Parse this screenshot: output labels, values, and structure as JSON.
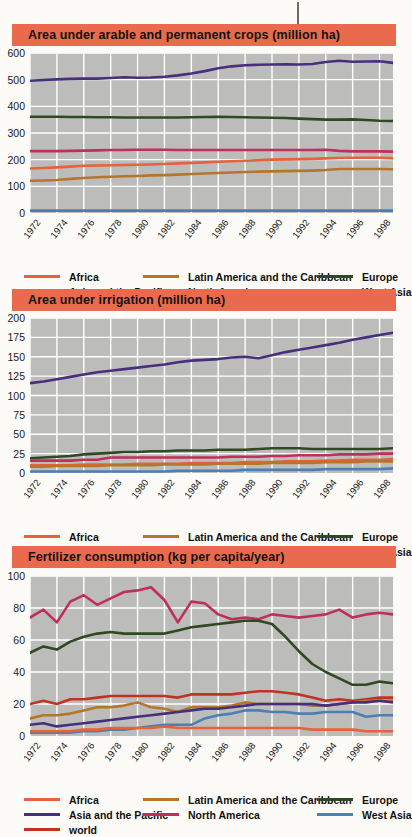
{
  "page": {
    "background": "#fdfbf7",
    "title_bar_color": "#ea6a4d",
    "plot_background": "#bcbcba",
    "grid_color": "#ffffff"
  },
  "series_colors": {
    "Africa": "#e8613a",
    "Asia and the Pacific": "#46307d",
    "Latin America and the Caribbean": "#b5762c",
    "North America": "#bf2f5c",
    "Europe": "#2f4a22",
    "West Asia": "#4b7fb5",
    "world": "#bf3322"
  },
  "legend": {
    "entries": [
      {
        "label": "Africa",
        "color": "#e8613a"
      },
      {
        "label": "Latin America and the Caribbean",
        "color": "#b5762c"
      },
      {
        "label": "Europe",
        "color": "#2f4a22"
      },
      {
        "label": "Asia and the Pacific",
        "color": "#46307d"
      },
      {
        "label": "North America",
        "color": "#bf2f5c"
      },
      {
        "label": "West Asia",
        "color": "#4b7fb5"
      },
      {
        "label": "world",
        "color": "#bf3322"
      }
    ]
  },
  "charts": [
    {
      "id": "arable",
      "title": "Area under arable and permanent crops (million ha)",
      "legend_labels": [
        "Africa",
        "Latin America and the Caribbean",
        "Europe",
        "Asia and the Pacific",
        "North America",
        "West Asia"
      ]
    },
    {
      "id": "irrigation",
      "title": "Area under irrigation (million ha)",
      "legend_labels": [
        "Africa",
        "Latin America and the Caribbean",
        "Europe",
        "Asia and the Pacific",
        "North America",
        "West Asia"
      ]
    },
    {
      "id": "fertilizer",
      "title": "Fertilizer consumption (kg per capita/year)",
      "legend_labels": [
        "Africa",
        "Latin America and the Caribbean",
        "Europe",
        "Asia and the Pacific",
        "North America",
        "West Asia",
        "world"
      ]
    }
  ],
  "chart_data": [
    {
      "type": "line",
      "id": "arable",
      "title": "Area under arable and permanent crops (million ha)",
      "xlabel": "",
      "ylabel": "million ha",
      "grid": true,
      "legend_position": "bottom",
      "xlim": [
        1972,
        1999
      ],
      "ylim": [
        0,
        600
      ],
      "yticks": [
        0,
        100,
        200,
        300,
        400,
        500,
        600
      ],
      "xticks": [
        1972,
        1974,
        1976,
        1978,
        1980,
        1982,
        1984,
        1986,
        1988,
        1990,
        1992,
        1994,
        1996,
        1998
      ],
      "x": [
        1972,
        1973,
        1974,
        1975,
        1976,
        1977,
        1978,
        1979,
        1980,
        1981,
        1982,
        1983,
        1984,
        1985,
        1986,
        1987,
        1988,
        1989,
        1990,
        1991,
        1992,
        1993,
        1994,
        1995,
        1996,
        1997,
        1998,
        1999
      ],
      "series": [
        {
          "name": "Asia and the Pacific",
          "color": "#46307d",
          "values": [
            496,
            499,
            501,
            503,
            504,
            504,
            506,
            509,
            507,
            508,
            511,
            516,
            523,
            532,
            543,
            550,
            554,
            556,
            557,
            558,
            557,
            559,
            566,
            571,
            567,
            568,
            569,
            563
          ]
        },
        {
          "name": "Europe",
          "color": "#2f4a22",
          "values": [
            361,
            361,
            361,
            360,
            360,
            359,
            359,
            358,
            358,
            358,
            358,
            358,
            359,
            360,
            361,
            360,
            359,
            358,
            357,
            356,
            354,
            352,
            350,
            350,
            351,
            349,
            346,
            345
          ]
        },
        {
          "name": "North America",
          "color": "#bf2f5c",
          "values": [
            232,
            232,
            232,
            233,
            234,
            235,
            236,
            236,
            237,
            237,
            237,
            236,
            236,
            236,
            236,
            236,
            236,
            236,
            236,
            236,
            236,
            236,
            237,
            233,
            231,
            231,
            231,
            230
          ]
        },
        {
          "name": "Africa",
          "color": "#e8613a",
          "values": [
            167,
            169,
            171,
            174,
            177,
            178,
            179,
            180,
            181,
            182,
            184,
            186,
            188,
            190,
            192,
            194,
            196,
            198,
            200,
            201,
            202,
            203,
            205,
            206,
            207,
            207,
            207,
            205
          ]
        },
        {
          "name": "Latin America and the Caribbean",
          "color": "#b5762c",
          "values": [
            121,
            122,
            124,
            128,
            131,
            134,
            136,
            138,
            139,
            141,
            142,
            144,
            146,
            148,
            150,
            152,
            154,
            155,
            156,
            157,
            158,
            159,
            161,
            165,
            165,
            165,
            165,
            164
          ]
        },
        {
          "name": "West Asia",
          "color": "#4b7fb5",
          "values": [
            9,
            9,
            9,
            9,
            9,
            9,
            9,
            9,
            9,
            9,
            9,
            9,
            9,
            9,
            9,
            9,
            9,
            9,
            9,
            9,
            9,
            9,
            9,
            9,
            9,
            9,
            9,
            9
          ]
        }
      ]
    },
    {
      "type": "line",
      "id": "irrigation",
      "title": "Area under irrigation (million ha)",
      "xlabel": "",
      "ylabel": "million ha",
      "grid": true,
      "legend_position": "bottom",
      "xlim": [
        1972,
        1999
      ],
      "ylim": [
        0,
        200
      ],
      "yticks": [
        0,
        25,
        50,
        75,
        100,
        125,
        150,
        175,
        200
      ],
      "xticks": [
        1972,
        1974,
        1976,
        1978,
        1980,
        1982,
        1984,
        1986,
        1988,
        1990,
        1992,
        1994,
        1996,
        1998
      ],
      "x": [
        1972,
        1973,
        1974,
        1975,
        1976,
        1977,
        1978,
        1979,
        1980,
        1981,
        1982,
        1983,
        1984,
        1985,
        1986,
        1987,
        1988,
        1989,
        1990,
        1991,
        1992,
        1993,
        1994,
        1995,
        1996,
        1997,
        1998,
        1999
      ],
      "series": [
        {
          "name": "Asia and the Pacific",
          "color": "#46307d",
          "values": [
            116,
            118,
            121,
            124,
            127,
            130,
            132,
            134,
            136,
            138,
            140,
            143,
            145,
            146,
            147,
            149,
            150,
            148,
            152,
            156,
            159,
            162,
            165,
            168,
            172,
            175,
            178,
            181
          ]
        },
        {
          "name": "Europe",
          "color": "#2f4a22",
          "values": [
            19,
            20,
            21,
            22,
            24,
            25,
            26,
            27,
            27,
            28,
            28,
            29,
            29,
            29,
            30,
            30,
            30,
            31,
            32,
            32,
            32,
            31,
            31,
            31,
            31,
            31,
            31,
            32
          ]
        },
        {
          "name": "North America",
          "color": "#bf2f5c",
          "values": [
            16,
            16,
            16,
            16,
            17,
            17,
            20,
            20,
            20,
            20,
            20,
            20,
            20,
            20,
            20,
            21,
            21,
            21,
            22,
            22,
            23,
            23,
            23,
            24,
            24,
            24,
            25,
            25
          ]
        },
        {
          "name": "Africa",
          "color": "#e8613a",
          "values": [
            10,
            10,
            10,
            10,
            11,
            11,
            11,
            11,
            12,
            12,
            12,
            12,
            13,
            13,
            13,
            13,
            14,
            14,
            14,
            15,
            15,
            15,
            16,
            16,
            17,
            17,
            17,
            18
          ]
        },
        {
          "name": "Latin America and the Caribbean",
          "color": "#b5762c",
          "values": [
            8,
            8,
            9,
            9,
            9,
            9,
            10,
            10,
            10,
            10,
            11,
            11,
            11,
            11,
            12,
            12,
            12,
            12,
            13,
            13,
            13,
            13,
            14,
            14,
            14,
            15,
            15,
            15
          ]
        },
        {
          "name": "West Asia",
          "color": "#4b7fb5",
          "values": [
            2,
            2,
            2,
            2,
            2,
            2,
            2,
            2,
            2,
            2,
            2,
            3,
            3,
            3,
            3,
            3,
            4,
            4,
            4,
            4,
            4,
            4,
            5,
            5,
            5,
            5,
            5,
            6
          ]
        }
      ]
    },
    {
      "type": "line",
      "id": "fertilizer",
      "title": "Fertilizer consumption (kg per capita/year)",
      "xlabel": "",
      "ylabel": "kg per capita/year",
      "grid": true,
      "legend_position": "bottom",
      "xlim": [
        1972,
        1999
      ],
      "ylim": [
        0,
        100
      ],
      "yticks": [
        0,
        20,
        40,
        60,
        80,
        100
      ],
      "xticks": [
        1972,
        1974,
        1976,
        1978,
        1980,
        1982,
        1984,
        1986,
        1988,
        1990,
        1992,
        1994,
        1996,
        1998
      ],
      "x": [
        1972,
        1973,
        1974,
        1975,
        1976,
        1977,
        1978,
        1979,
        1980,
        1981,
        1982,
        1983,
        1984,
        1985,
        1986,
        1987,
        1988,
        1989,
        1990,
        1991,
        1992,
        1993,
        1994,
        1995,
        1996,
        1997,
        1998,
        1999
      ],
      "series": [
        {
          "name": "North America",
          "color": "#bf2f5c",
          "values": [
            74,
            79,
            71,
            84,
            88,
            82,
            86,
            90,
            91,
            93,
            85,
            71,
            84,
            83,
            76,
            73,
            74,
            73,
            76,
            75,
            74,
            75,
            76,
            79,
            74,
            76,
            77,
            76
          ]
        },
        {
          "name": "Europe",
          "color": "#2f4a22",
          "values": [
            52,
            56,
            54,
            59,
            62,
            64,
            65,
            64,
            64,
            64,
            64,
            66,
            68,
            69,
            70,
            71,
            72,
            72,
            70,
            62,
            53,
            45,
            40,
            36,
            32,
            32,
            34,
            33
          ]
        },
        {
          "name": "world",
          "color": "#bf3322",
          "values": [
            20,
            22,
            20,
            23,
            23,
            24,
            25,
            25,
            25,
            25,
            25,
            24,
            26,
            26,
            26,
            26,
            27,
            28,
            28,
            27,
            26,
            24,
            22,
            23,
            22,
            23,
            24,
            24
          ]
        },
        {
          "name": "Latin America and the Caribbean",
          "color": "#b5762c",
          "values": [
            11,
            13,
            13,
            14,
            16,
            18,
            18,
            19,
            21,
            18,
            17,
            15,
            18,
            18,
            18,
            19,
            21,
            20,
            20,
            20,
            20,
            19,
            19,
            20,
            21,
            22,
            22,
            22
          ]
        },
        {
          "name": "Asia and the Pacific",
          "color": "#46307d",
          "values": [
            7,
            8,
            6,
            7,
            8,
            9,
            10,
            11,
            12,
            13,
            14,
            15,
            16,
            17,
            17,
            18,
            19,
            20,
            20,
            20,
            20,
            20,
            19,
            20,
            21,
            21,
            22,
            21
          ]
        },
        {
          "name": "West Asia",
          "color": "#4b7fb5",
          "values": [
            2,
            2,
            2,
            2,
            3,
            3,
            4,
            4,
            5,
            6,
            7,
            7,
            7,
            11,
            13,
            14,
            16,
            16,
            15,
            15,
            14,
            14,
            15,
            15,
            15,
            12,
            13,
            13
          ]
        },
        {
          "name": "Africa",
          "color": "#e8613a",
          "values": [
            3,
            3,
            3,
            3,
            4,
            4,
            5,
            5,
            5,
            5,
            6,
            5,
            5,
            5,
            5,
            5,
            5,
            5,
            5,
            5,
            5,
            4,
            4,
            4,
            4,
            3,
            3,
            3
          ]
        }
      ]
    }
  ]
}
